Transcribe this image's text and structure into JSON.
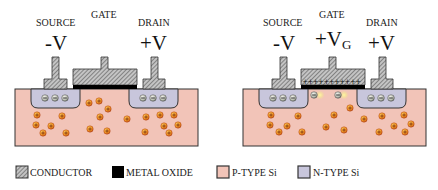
{
  "colors": {
    "conductor_fill": "#b8b8b8",
    "conductor_hatch": "#555555",
    "metal_oxide": "#000000",
    "p_type": "#f2c4b8",
    "n_type": "#c8c6dc",
    "hole": "#f0a020",
    "hole_edge": "#c0501a",
    "electron": "#c8ccc4",
    "electron_glow": "#f2ec7a",
    "outline": "#333333"
  },
  "devices": [
    {
      "id": "off",
      "source": {
        "label": "SOURCE",
        "voltage": "-V"
      },
      "gate": {
        "label": "GATE",
        "voltage": "",
        "voltage_sub": ""
      },
      "drain": {
        "label": "DRAIN",
        "voltage": "+V"
      },
      "channel_formed": false
    },
    {
      "id": "on",
      "source": {
        "label": "SOURCE",
        "voltage": "-V"
      },
      "gate": {
        "label": "GATE",
        "voltage": "+V",
        "voltage_sub": "G"
      },
      "drain": {
        "label": "DRAIN",
        "voltage": "+V"
      },
      "channel_formed": true
    }
  ],
  "legend": [
    {
      "key": "conductor",
      "label": "CONDUCTOR"
    },
    {
      "key": "metal_oxide",
      "label": "METAL OXIDE"
    },
    {
      "key": "p_type",
      "label": "P-TYPE Si"
    },
    {
      "key": "n_type",
      "label": "N-TYPE Si"
    }
  ]
}
